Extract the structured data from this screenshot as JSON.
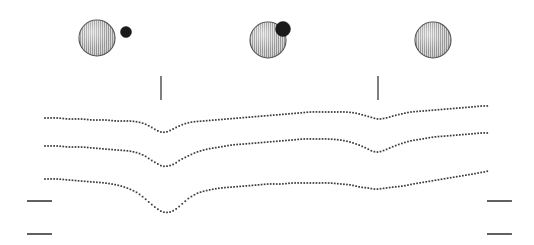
{
  "figure": {
    "title": "",
    "width": 534,
    "height": 245,
    "background_color": "#ffffff",
    "ink_color": "#2b2b2b",
    "dot_color": "#3a3a3a"
  },
  "sphere_group": {
    "label": "orbital-configuration-row",
    "sphere_fill": "#c9c9c9",
    "sphere_stroke": "#4a4a4a",
    "companion_fill": "#1a1a1a",
    "items": [
      {
        "name": "configuration-1",
        "caption": "",
        "sphere": {
          "cx": 97,
          "cy": 38,
          "r": 18
        },
        "companion": {
          "cx": 126,
          "cy": 32,
          "r": 5.5,
          "visible": true
        }
      },
      {
        "name": "configuration-2",
        "caption": "",
        "sphere": {
          "cx": 268,
          "cy": 40,
          "r": 18
        },
        "companion": {
          "cx": 283,
          "cy": 29,
          "r": 7.5,
          "visible": true
        }
      },
      {
        "name": "configuration-3",
        "caption": "",
        "sphere": {
          "cx": 433,
          "cy": 40,
          "r": 18
        },
        "companion": {
          "cx": 433,
          "cy": 40,
          "r": 0,
          "visible": false
        }
      }
    ]
  },
  "tick_marks": {
    "label": "phase-marker-ticks",
    "color": "#3a3a3a",
    "items": [
      {
        "name": "tick-left",
        "x": 161,
        "y1": 76,
        "y2": 100
      },
      {
        "name": "tick-right",
        "x": 378,
        "y1": 76,
        "y2": 100
      }
    ]
  },
  "baseline_marks": {
    "label": "baseline-reference-marks",
    "color": "#3a3a3a",
    "items": [
      {
        "name": "baseline-mark-top-left",
        "x1": 27,
        "x2": 52,
        "y": 201
      },
      {
        "name": "baseline-mark-bottom-left",
        "x1": 27,
        "x2": 52,
        "y": 234
      },
      {
        "name": "baseline-mark-top-right",
        "x1": 487,
        "x2": 512,
        "y": 201
      },
      {
        "name": "baseline-mark-bottom-right",
        "x1": 487,
        "x2": 512,
        "y": 234
      }
    ]
  },
  "chart_data": {
    "type": "line",
    "title": "",
    "subtitle": "",
    "xlabel": "",
    "ylabel": "",
    "grid": false,
    "legend": "none",
    "style": "dotted",
    "xlim": [
      45,
      489
    ],
    "ylim": [
      245,
      100
    ],
    "annotations": [
      "primary eclipse dip near x=161",
      "secondary eclipse dip near x=378"
    ],
    "series": [
      {
        "name": "light-curve-top",
        "baseline_y": 119,
        "primary_dip": {
          "x": 161,
          "depth": 13,
          "half_width": 26
        },
        "secondary_dip": {
          "x": 378,
          "depth": 7,
          "half_width": 24
        },
        "x": [
          45,
          57,
          69,
          81,
          93,
          105,
          117,
          129,
          138,
          145,
          151,
          156,
          161,
          166,
          171,
          177,
          184,
          192,
          203,
          215,
          227,
          239,
          251,
          263,
          275,
          287,
          299,
          311,
          323,
          335,
          345,
          355,
          363,
          370,
          378,
          386,
          393,
          401,
          411,
          423,
          435,
          447,
          459,
          471,
          483,
          489
        ],
        "y": [
          118,
          118,
          119,
          119,
          120,
          120,
          121,
          121,
          122,
          124,
          127,
          130,
          132,
          132,
          130,
          127,
          124,
          122,
          121,
          120,
          119,
          118,
          117,
          116,
          115,
          114,
          113,
          112,
          112,
          112,
          112,
          113,
          115,
          117,
          119,
          118,
          116,
          114,
          112,
          111,
          110,
          109,
          108,
          107,
          106,
          106
        ]
      },
      {
        "name": "light-curve-middle",
        "baseline_y": 147,
        "primary_dip": {
          "x": 162,
          "depth": 19,
          "half_width": 30
        },
        "secondary_dip": {
          "x": 378,
          "depth": 9,
          "half_width": 26
        },
        "x": [
          45,
          57,
          69,
          81,
          93,
          105,
          117,
          129,
          138,
          145,
          151,
          156,
          162,
          168,
          174,
          180,
          188,
          197,
          208,
          220,
          232,
          244,
          256,
          268,
          280,
          292,
          304,
          316,
          328,
          340,
          350,
          359,
          366,
          372,
          378,
          385,
          392,
          400,
          410,
          422,
          434,
          446,
          458,
          470,
          482,
          489
        ],
        "y": [
          146,
          146,
          147,
          147,
          148,
          149,
          150,
          151,
          153,
          156,
          160,
          163,
          166,
          166,
          164,
          160,
          156,
          152,
          149,
          147,
          145,
          144,
          143,
          142,
          141,
          140,
          139,
          139,
          139,
          140,
          142,
          145,
          148,
          151,
          152,
          150,
          147,
          144,
          141,
          139,
          137,
          136,
          135,
          134,
          133,
          133
        ]
      },
      {
        "name": "light-curve-bottom",
        "baseline_y": 180,
        "primary_dip": {
          "x": 163,
          "depth": 32,
          "half_width": 36
        },
        "secondary_dip": {
          "x": 378,
          "depth": 4,
          "half_width": 30
        },
        "x": [
          45,
          57,
          69,
          81,
          93,
          105,
          117,
          127,
          136,
          143,
          150,
          156,
          163,
          170,
          176,
          182,
          189,
          198,
          209,
          221,
          233,
          245,
          257,
          269,
          281,
          293,
          305,
          317,
          329,
          341,
          351,
          360,
          368,
          374,
          378,
          386,
          394,
          403,
          413,
          425,
          437,
          449,
          461,
          473,
          484,
          489
        ],
        "y": [
          179,
          179,
          180,
          181,
          182,
          183,
          185,
          188,
          192,
          197,
          203,
          208,
          212,
          212,
          209,
          204,
          198,
          193,
          190,
          188,
          187,
          186,
          185,
          184,
          184,
          183,
          183,
          183,
          183,
          184,
          185,
          187,
          188,
          189,
          189,
          188,
          187,
          186,
          184,
          182,
          180,
          178,
          176,
          174,
          172,
          171
        ]
      }
    ]
  }
}
